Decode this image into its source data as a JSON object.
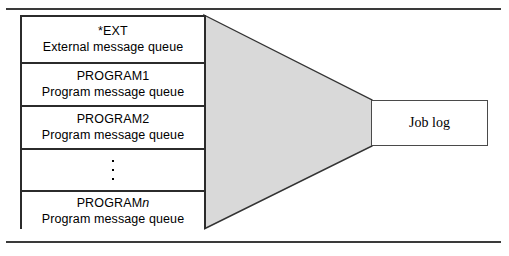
{
  "diagram": {
    "colors": {
      "funnel_fill": "#d9d9d9",
      "funnel_stroke": "#333333",
      "box_stroke": "#2b2b2b",
      "frame_rule": "#3a3a3a",
      "background": "#ffffff",
      "text": "#000000"
    },
    "queues": [
      {
        "name": "*EXT",
        "description": "External message queue",
        "italic_suffix": ""
      },
      {
        "name": "PROGRAM1",
        "description": "Program message queue",
        "italic_suffix": ""
      },
      {
        "name": "PROGRAM2",
        "description": "Program message queue",
        "italic_suffix": ""
      },
      {
        "name": "",
        "description": "",
        "italic_suffix": ""
      },
      {
        "name": "PROGRAM",
        "description": "Program message queue",
        "italic_suffix": "n"
      }
    ],
    "ellipsis_dots": 3,
    "output": {
      "label": "Job log"
    }
  }
}
